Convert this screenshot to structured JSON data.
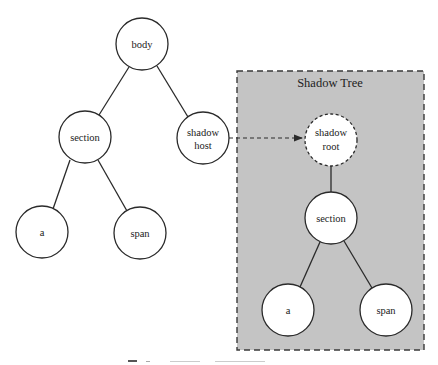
{
  "diagram": {
    "title": "Shadow Tree",
    "caption": "",
    "light_tree": {
      "nodes": [
        {
          "id": "body",
          "lines": [
            "body"
          ],
          "cx": 142,
          "cy": 44
        },
        {
          "id": "section",
          "lines": [
            "section"
          ],
          "cx": 85,
          "cy": 137
        },
        {
          "id": "shadow-host",
          "lines": [
            "shadow",
            "host"
          ],
          "cx": 203,
          "cy": 138
        },
        {
          "id": "a",
          "lines": [
            "a"
          ],
          "cx": 42,
          "cy": 232
        },
        {
          "id": "span",
          "lines": [
            "span"
          ],
          "cx": 140,
          "cy": 233
        }
      ],
      "edges": [
        [
          "body",
          "section"
        ],
        [
          "body",
          "shadow-host"
        ],
        [
          "section",
          "a"
        ],
        [
          "section",
          "span"
        ]
      ]
    },
    "shadow_tree": {
      "nodes": [
        {
          "id": "shadow-root",
          "lines": [
            "shadow",
            "root"
          ],
          "cx": 331,
          "cy": 140,
          "dashed": true
        },
        {
          "id": "section",
          "lines": [
            "section"
          ],
          "cx": 331,
          "cy": 218
        },
        {
          "id": "a",
          "lines": [
            "a"
          ],
          "cx": 288,
          "cy": 310
        },
        {
          "id": "span",
          "lines": [
            "span"
          ],
          "cx": 386,
          "cy": 310
        }
      ],
      "edges": [
        [
          "shadow-root",
          "section"
        ],
        [
          "section",
          "a"
        ],
        [
          "section",
          "span"
        ]
      ]
    },
    "connector": {
      "from": "shadow-host",
      "to": "shadow-root",
      "style": "dashed-arrow"
    },
    "colors": {
      "shadow_box_fill": "#c4c4c4",
      "stroke": "#2a2a2a",
      "node_fill": "#ffffff"
    }
  }
}
